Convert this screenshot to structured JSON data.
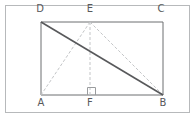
{
  "figure": {
    "kind": "geometry-diagram",
    "canvas": {
      "width": 196,
      "height": 121,
      "background": "#ffffff"
    },
    "frame": {
      "name": "image-border",
      "x": 5.5,
      "y": 5.5,
      "width": 184,
      "height": 107,
      "stroke": "#b7b9bb",
      "stroke_width": 1
    },
    "colors": {
      "rectangle_stroke": "#6d6e71",
      "solid_diagonal_stroke": "#58595b",
      "dashed_stroke": "#c3c5c7",
      "right_angle_stroke": "#9a9c9e",
      "label_text": "#58595b"
    },
    "points": {
      "A": {
        "label": "A",
        "x": 41,
        "y": 95,
        "label_x": 41,
        "label_y": 98
      },
      "B": {
        "label": "B",
        "x": 163,
        "y": 95,
        "label_x": 163,
        "label_y": 98
      },
      "C": {
        "label": "C",
        "x": 163,
        "y": 22,
        "label_x": 161,
        "label_y": 9
      },
      "D": {
        "label": "D",
        "x": 41,
        "y": 22,
        "label_x": 40,
        "label_y": 9
      },
      "E": {
        "label": "E",
        "x": 90,
        "y": 22,
        "label_x": 90,
        "label_y": 9
      },
      "F": {
        "label": "F",
        "x": 90,
        "y": 95,
        "label_x": 90,
        "label_y": 98
      }
    },
    "segments": [
      {
        "name": "side-DC",
        "from": "D",
        "to": "C",
        "style": "solid",
        "stroke": "#6d6e71",
        "width": 1
      },
      {
        "name": "side-CB",
        "from": "C",
        "to": "B",
        "style": "solid",
        "stroke": "#6d6e71",
        "width": 1
      },
      {
        "name": "side-BA",
        "from": "B",
        "to": "A",
        "style": "solid",
        "stroke": "#6d6e71",
        "width": 1
      },
      {
        "name": "side-AD",
        "from": "A",
        "to": "D",
        "style": "solid",
        "stroke": "#6d6e71",
        "width": 1
      },
      {
        "name": "diagonal-DB",
        "from": "D",
        "to": "B",
        "style": "solid",
        "stroke": "#58595b",
        "width": 1.6
      },
      {
        "name": "segment-EA",
        "from": "E",
        "to": "A",
        "style": "dashed",
        "stroke": "#c3c5c7",
        "width": 1,
        "dash": "3 2"
      },
      {
        "name": "segment-EF",
        "from": "E",
        "to": "F",
        "style": "dashed",
        "stroke": "#c3c5c7",
        "width": 1,
        "dash": "3 2"
      },
      {
        "name": "segment-EB",
        "from": "E",
        "to": "B",
        "style": "dashed",
        "stroke": "#c3c5c7",
        "width": 1,
        "dash": "3 2"
      }
    ],
    "right_angle_marker": {
      "name": "right-angle-at-F",
      "at": "F",
      "x": 87.5,
      "y": 87.5,
      "size": 8,
      "stroke": "#9a9c9e"
    }
  }
}
